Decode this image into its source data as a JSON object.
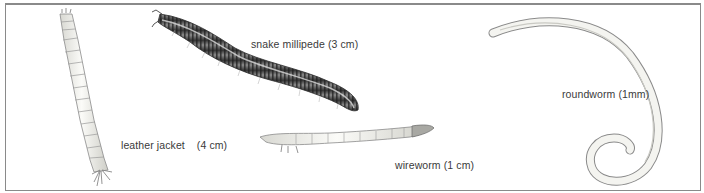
{
  "figure": {
    "specimens": [
      {
        "id": "leather-jacket",
        "name": "leather jacket",
        "size": "(4 cm)"
      },
      {
        "id": "snake-millipede",
        "label": "snake millipede (3 cm)"
      },
      {
        "id": "wireworm",
        "label": "wireworm (1 cm)"
      },
      {
        "id": "roundworm",
        "label": "roundworm (1mm)"
      }
    ]
  },
  "colors": {
    "border": "#8a8a8a",
    "text": "#3a3a3a",
    "millipede_dark": "#3b3b3b",
    "larva_light": "#f2f2ee",
    "outline": "#7a7a7a"
  }
}
